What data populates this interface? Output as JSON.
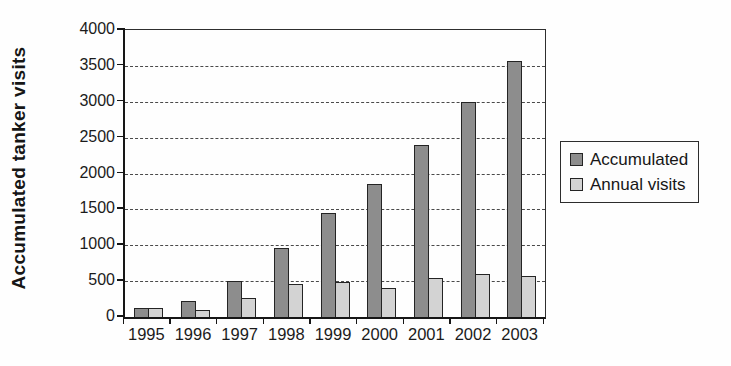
{
  "figure": {
    "background": "#fefefe",
    "frame_color": "#2e2e2e",
    "axis_color": "#161616"
  },
  "legend": {
    "items": [
      {
        "label": "Accumulated",
        "color": "#8d8d8d"
      },
      {
        "label": "Annual visits",
        "color": "#d3d3d3"
      }
    ]
  },
  "chart_data": {
    "type": "bar",
    "title": "",
    "categories": [
      "1995",
      "1996",
      "1997",
      "1998",
      "1999",
      "2000",
      "2001",
      "2002",
      "2003"
    ],
    "series": [
      {
        "name": "Accumulated",
        "color": "#8d8d8d",
        "values": [
          130,
          230,
          500,
          960,
          1450,
          1850,
          2400,
          3000,
          3570
        ]
      },
      {
        "name": "Annual visits",
        "color": "#d3d3d3",
        "values": [
          130,
          100,
          270,
          460,
          490,
          400,
          550,
          600,
          570
        ]
      }
    ],
    "xlabel": "",
    "ylabel": "Accumulated tanker visits",
    "ylim": [
      0,
      4000
    ],
    "yticks": [
      0,
      500,
      1000,
      1500,
      2000,
      2500,
      3000,
      3500,
      4000
    ],
    "grid": "horizontal-dashed",
    "legend_position": "right"
  }
}
